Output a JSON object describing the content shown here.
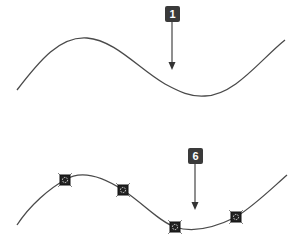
{
  "panels": [
    {
      "id": "top",
      "badge": "1",
      "curve_path": "M17,90 C40,60 60,36 87,38 C115,40 140,70 165,84 C180,92 190,97 205,96 C235,95 260,60 285,40",
      "arrow": {
        "x": 172,
        "y1": 20,
        "y2": 70
      },
      "anchors": []
    },
    {
      "id": "bottom",
      "badge": "6",
      "curve_path": "M17,225 C30,205 50,188 65,180 C80,170 100,175 123,190 C145,205 160,222 175,227 C190,232 210,230 236,217 C255,205 270,190 287,175",
      "arrow": {
        "x": 195,
        "y1": 162,
        "y2": 210
      },
      "anchors": [
        {
          "x": 65,
          "y": 180
        },
        {
          "x": 123,
          "y": 190
        },
        {
          "x": 175,
          "y": 227
        },
        {
          "x": 236,
          "y": 217
        }
      ]
    }
  ],
  "colors": {
    "curve": "#4a4a4a",
    "badge": "#3a3a3a",
    "arrow": "#333333",
    "anchor": "#222222"
  }
}
